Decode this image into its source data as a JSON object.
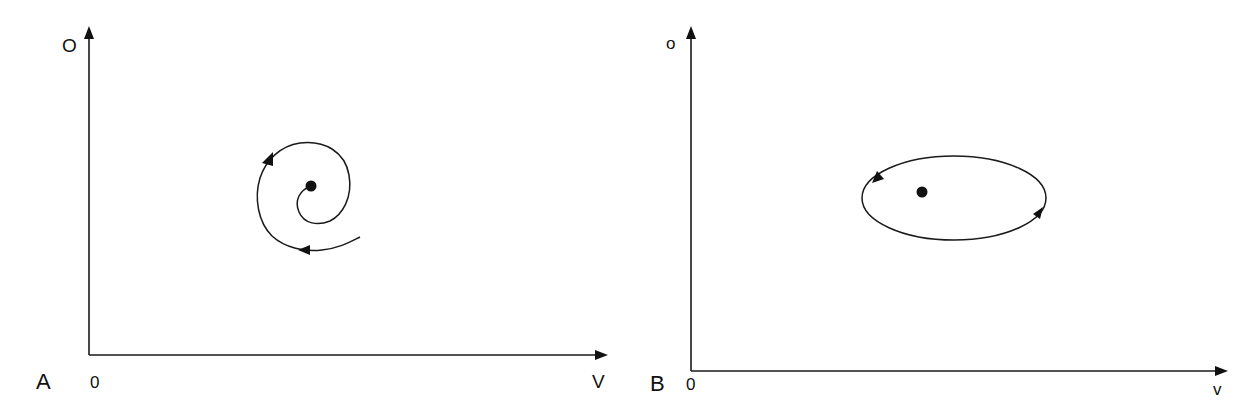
{
  "figure": {
    "colors": {
      "ink": "#111111",
      "background": "#ffffff"
    },
    "panels": [
      {
        "id": "A",
        "panel_label": "A",
        "origin_label": "0",
        "x_axis_label": "V",
        "y_axis_label": "O",
        "trajectory": "spiral converging to fixed point",
        "flow_direction": "inward spiral, arrows pointing along the path toward the central fixed point",
        "fixed_point": "stable focus"
      },
      {
        "id": "B",
        "panel_label": "B",
        "origin_label": "0",
        "x_axis_label": "v",
        "y_axis_label": "o",
        "trajectory": "closed elliptical orbit around fixed point",
        "flow_direction": "closed loop, arrows indicating continuous circulation",
        "fixed_point": "center"
      }
    ]
  }
}
